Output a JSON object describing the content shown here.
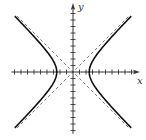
{
  "chart_data": {
    "type": "line",
    "title": "",
    "xlabel": "x",
    "ylabel": "y",
    "a": 2.5,
    "b": 2.5,
    "xlim": [
      -9.5,
      10
    ],
    "ylim": [
      -9.5,
      10.5
    ],
    "grid": false,
    "tick_spacing": 1,
    "x_ticks": [
      -9,
      -8,
      -7,
      -6,
      -5,
      -4,
      -3,
      -2,
      -1,
      1,
      2,
      3,
      4,
      5,
      6,
      7,
      8,
      9
    ],
    "y_ticks": [
      -9,
      -8,
      -7,
      -6,
      -5,
      -4,
      -3,
      -2,
      -1,
      1,
      2,
      3,
      4,
      5,
      6,
      7,
      8,
      9
    ],
    "series": [
      {
        "name": "hyperbola right branch",
        "style": "solid",
        "x": [
          8.7,
          5.59,
          3.54,
          2.5,
          3.54,
          5.59,
          8.7
        ],
        "y": [
          -8.3,
          -5,
          -2.5,
          0,
          2.5,
          5,
          8.3
        ]
      },
      {
        "name": "hyperbola left branch",
        "style": "solid",
        "x": [
          -8.7,
          -5.59,
          -3.54,
          -2.5,
          -3.54,
          -5.59,
          -8.7
        ],
        "y": [
          -8.3,
          -5,
          -2.5,
          0,
          2.5,
          5,
          8.3
        ]
      },
      {
        "name": "asymptote y = x",
        "style": "dashed",
        "x": [
          -8.6,
          8.6
        ],
        "y": [
          -8.6,
          8.6
        ]
      },
      {
        "name": "asymptote y = -x",
        "style": "dashed",
        "x": [
          -8.6,
          8.6
        ],
        "y": [
          8.6,
          -8.6
        ]
      }
    ],
    "labels": {
      "x": "x",
      "y": "y"
    }
  }
}
